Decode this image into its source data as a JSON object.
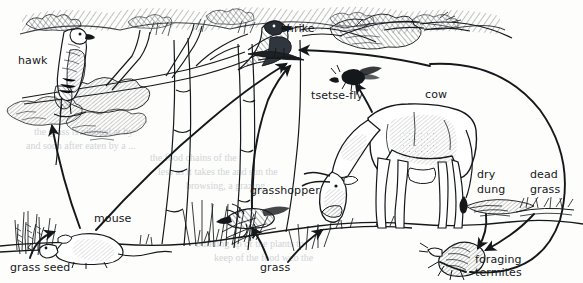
{
  "diagram": {
    "type": "illustrated-food-web",
    "width": 583,
    "height": 283,
    "style": "pen-and-ink line drawing with hatched shading on aged paper",
    "colors": {
      "ink": "#15181b",
      "paper": "#fdfdfb",
      "shade": "#6c7278",
      "ghost_text": "#c9cdd2"
    }
  },
  "labels": {
    "hawk": "hawk",
    "shrike": "shrike",
    "tsetse_fly": "tsetse-fly",
    "cow": "cow",
    "grasshopper": "grasshopper",
    "mouse": "mouse",
    "grass_seed": "grass seed",
    "grass": "grass",
    "dry_dung_line1": "dry",
    "dry_dung_line2": "dung",
    "dead_grass_line1": "dead",
    "dead_grass_line2": "grass",
    "foraging_termites_line1": "foraging",
    "foraging_termites_line2": "termites"
  },
  "organisms": [
    {
      "name": "hawk",
      "role": "top predator (raptor)",
      "label": "hawk",
      "x": 33,
      "y": 61
    },
    {
      "name": "shrike",
      "role": "predatory bird",
      "label": "shrike",
      "x": 296,
      "y": 29
    },
    {
      "name": "tsetse-fly",
      "role": "blood-feeding insect parasite",
      "label": "tsetse-fly",
      "x": 337,
      "y": 96
    },
    {
      "name": "cow",
      "role": "large grazing herbivore",
      "label": "cow",
      "x": 439,
      "y": 95
    },
    {
      "name": "grasshopper",
      "role": "herbivorous insect",
      "label": "grasshopper",
      "x": 283,
      "y": 191
    },
    {
      "name": "mouse",
      "role": "seed-eating rodent",
      "label": "mouse",
      "x": 115,
      "y": 219
    },
    {
      "name": "grass-seed",
      "role": "producer (seed)",
      "label": "grass seed",
      "x": 40,
      "y": 268
    },
    {
      "name": "grass",
      "role": "producer (living plant)",
      "label": "grass",
      "x": 276,
      "y": 268
    },
    {
      "name": "dry-dung",
      "role": "detritus from cow",
      "label": "dry dung",
      "x": 490,
      "y": 183
    },
    {
      "name": "dead-grass",
      "role": "plant detritus",
      "label": "dead grass",
      "x": 544,
      "y": 183
    },
    {
      "name": "foraging-termites",
      "role": "detritivore insect",
      "label": "foraging termites",
      "x": 503,
      "y": 267
    }
  ],
  "feeding_links": [
    {
      "from": "grass seed",
      "to": "mouse"
    },
    {
      "from": "mouse",
      "to": "hawk"
    },
    {
      "from": "mouse",
      "to": "shrike"
    },
    {
      "from": "grass",
      "to": "grasshopper"
    },
    {
      "from": "grasshopper",
      "to": "shrike"
    },
    {
      "from": "grass",
      "to": "cow"
    },
    {
      "from": "cow",
      "to": "tsetse-fly"
    },
    {
      "from": "tsetse-fly",
      "to": "shrike"
    },
    {
      "from": "dry dung",
      "to": "foraging termites"
    },
    {
      "from": "dead grass",
      "to": "foraging termites"
    },
    {
      "from": "foraging termites",
      "to": "shrike"
    }
  ],
  "ghost_text": [
    {
      "text": "the grass is nibbled at by",
      "x": 34,
      "y": 126
    },
    {
      "text": "and soon after eaten by a ...",
      "x": 26,
      "y": 140
    },
    {
      "text": "the food chains of the",
      "x": 150,
      "y": 152
    },
    {
      "text": "less as it takes the and sun the",
      "x": 158,
      "y": 166
    },
    {
      "text": "browsing, a grazing",
      "x": 186,
      "y": 180
    },
    {
      "text": "building up of the plants to",
      "x": 196,
      "y": 238
    },
    {
      "text": "keep of the food web the",
      "x": 214,
      "y": 252
    },
    {
      "text": "the first of all",
      "x": 404,
      "y": 116
    },
    {
      "text": "steps that cut into",
      "x": 390,
      "y": 130
    }
  ]
}
